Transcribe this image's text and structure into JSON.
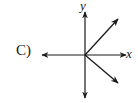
{
  "option": {
    "label": "C)"
  },
  "axes": {
    "x_label": "x",
    "y_label": "y"
  },
  "diagram": {
    "origin": [
      85,
      55
    ],
    "line_color": "#1a1a1a",
    "vectors": [
      {
        "name": "upper-right",
        "to": [
          118,
          19
        ]
      },
      {
        "name": "lower-right",
        "to": [
          118,
          83
        ]
      }
    ]
  }
}
